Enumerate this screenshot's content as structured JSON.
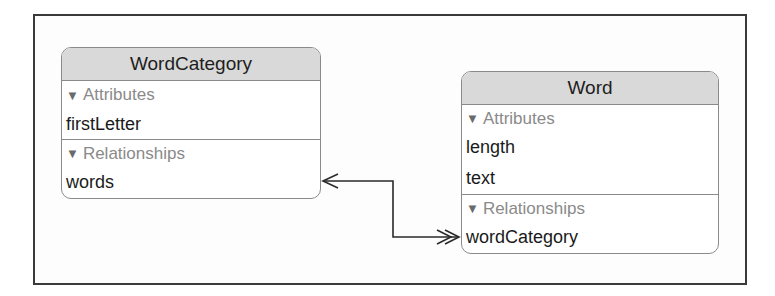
{
  "diagram": {
    "entities": [
      {
        "name": "WordCategory",
        "sections": [
          {
            "label": "Attributes",
            "items": [
              "firstLetter"
            ]
          },
          {
            "label": "Relationships",
            "items": [
              "words"
            ]
          }
        ]
      },
      {
        "name": "Word",
        "sections": [
          {
            "label": "Attributes",
            "items": [
              "length",
              "text"
            ]
          },
          {
            "label": "Relationships",
            "items": [
              "wordCategory"
            ]
          }
        ]
      }
    ],
    "relationships": [
      {
        "from": "WordCategory.words",
        "to": "Word.wordCategory",
        "from_arrow": "single",
        "to_arrow": "double"
      }
    ],
    "icons": {
      "disclosure": "▼"
    },
    "colors": {
      "header_bg": "#d9d9d9",
      "border": "#8a8a8a",
      "section_label": "#8a8a8a",
      "text": "#1a1a1a",
      "connector": "#2a2a2a"
    }
  }
}
